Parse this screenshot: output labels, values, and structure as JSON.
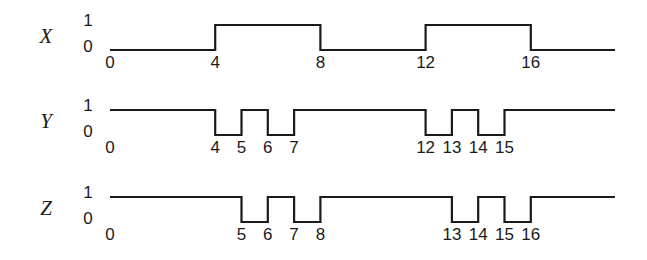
{
  "figure": {
    "type": "timing-diagram",
    "background_color": "#ffffff",
    "line_color": "#1a1a1a",
    "level_labels": {
      "high": "1",
      "low": "0"
    },
    "time_unit_px": 26.3,
    "origin_px": 110,
    "line_end_px": 615,
    "high_y_px": 25,
    "low_y_px": 50
  },
  "signals": [
    {
      "name": "X",
      "id": "x",
      "initial_level": 0,
      "transitions": [
        4,
        8,
        12,
        16
      ],
      "tick_labels": [
        "0",
        "4",
        "8",
        "12",
        "16"
      ],
      "tick_times": [
        0,
        4,
        8,
        12,
        16
      ],
      "segments": [
        {
          "from": 0,
          "to": 4,
          "level": 0
        },
        {
          "from": 4,
          "to": 8,
          "level": 1
        },
        {
          "from": 8,
          "to": 12,
          "level": 0
        },
        {
          "from": 12,
          "to": 16,
          "level": 1
        },
        {
          "from": 16,
          "to": 19.2,
          "level": 0
        }
      ]
    },
    {
      "name": "Y",
      "id": "y",
      "initial_level": 1,
      "transitions": [
        4,
        5,
        6,
        7,
        12,
        13,
        14,
        15
      ],
      "tick_labels": [
        "0",
        "4",
        "5",
        "6",
        "7",
        "12",
        "13",
        "14",
        "15"
      ],
      "tick_times": [
        0,
        4,
        5,
        6,
        7,
        12,
        13,
        14,
        15
      ],
      "segments": [
        {
          "from": 0,
          "to": 4,
          "level": 1
        },
        {
          "from": 4,
          "to": 5,
          "level": 0
        },
        {
          "from": 5,
          "to": 6,
          "level": 1
        },
        {
          "from": 6,
          "to": 7,
          "level": 0
        },
        {
          "from": 7,
          "to": 12,
          "level": 1
        },
        {
          "from": 12,
          "to": 13,
          "level": 0
        },
        {
          "from": 13,
          "to": 14,
          "level": 1
        },
        {
          "from": 14,
          "to": 15,
          "level": 0
        },
        {
          "from": 15,
          "to": 19.2,
          "level": 1
        }
      ]
    },
    {
      "name": "Z",
      "id": "z",
      "initial_level": 1,
      "transitions": [
        5,
        6,
        7,
        8,
        13,
        14,
        15,
        16
      ],
      "tick_labels": [
        "0",
        "5",
        "6",
        "7",
        "8",
        "13",
        "14",
        "15",
        "16"
      ],
      "tick_times": [
        0,
        5,
        6,
        7,
        8,
        13,
        14,
        15,
        16
      ],
      "segments": [
        {
          "from": 0,
          "to": 5,
          "level": 1
        },
        {
          "from": 5,
          "to": 6,
          "level": 0
        },
        {
          "from": 6,
          "to": 7,
          "level": 1
        },
        {
          "from": 7,
          "to": 8,
          "level": 0
        },
        {
          "from": 8,
          "to": 13,
          "level": 1
        },
        {
          "from": 13,
          "to": 14,
          "level": 0
        },
        {
          "from": 14,
          "to": 15,
          "level": 1
        },
        {
          "from": 15,
          "to": 16,
          "level": 0
        },
        {
          "from": 16,
          "to": 19.2,
          "level": 1
        }
      ]
    }
  ]
}
